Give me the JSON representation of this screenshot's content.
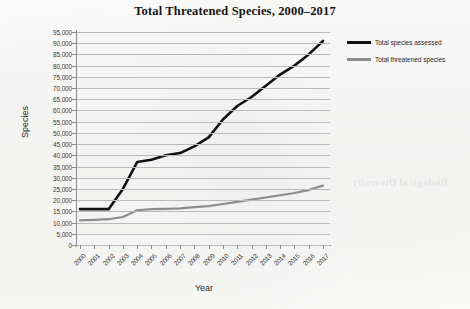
{
  "chart_data": {
    "type": "line",
    "title": "Total Threatened Species, 2000–2017",
    "xlabel": "Year",
    "ylabel": "Species",
    "categories": [
      "2000",
      "2001",
      "2002",
      "2003",
      "2004",
      "2005",
      "2006",
      "2007",
      "2008",
      "2009",
      "2010",
      "2011",
      "2012",
      "2013",
      "2014",
      "2015",
      "2016",
      "2017"
    ],
    "ylim": [
      0,
      95000
    ],
    "ytick_step": 5000,
    "ytick_labels": [
      "95,000",
      "90,000",
      "85,000",
      "80,000",
      "75,000",
      "70,000",
      "65,000",
      "60,000",
      "55,000",
      "50,000",
      "45,000",
      "40,000",
      "35,000",
      "30,000",
      "25,000",
      "20,000",
      "15,000",
      "10,000",
      "5,000",
      "0"
    ],
    "grid": true,
    "legend_position": "right",
    "series": [
      {
        "name": "Total species assessed",
        "color": "#111111",
        "values": [
          16000,
          16000,
          16000,
          25000,
          37000,
          38000,
          40000,
          41000,
          44000,
          48000,
          56000,
          62000,
          66000,
          71000,
          76000,
          80000,
          85000,
          91000
        ]
      },
      {
        "name": "Total threatened species",
        "color": "#8c8c8c",
        "values": [
          11000,
          11200,
          11500,
          12500,
          15500,
          16000,
          16100,
          16300,
          16900,
          17300,
          18300,
          19200,
          20200,
          21200,
          22200,
          23200,
          24500,
          26500
        ]
      }
    ],
    "annotations": []
  },
  "bleed_text": "Biological Diversity"
}
